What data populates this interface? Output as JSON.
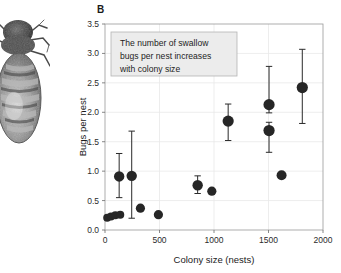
{
  "figure": {
    "panel_label": "B",
    "photo_alt": "swallow-bug-photograph"
  },
  "annotation": {
    "lines": [
      "The number of swallow",
      "bugs per nest increases",
      "with colony size"
    ],
    "fill_color": "#ececec",
    "border_color": "#b4b4b4"
  },
  "chart_data": {
    "type": "scatter",
    "title": "",
    "xlabel": "Colony size (nests)",
    "ylabel": "Bugs per nest",
    "xlim": [
      0,
      2000
    ],
    "ylim": [
      0.0,
      3.5
    ],
    "xticks": [
      0,
      500,
      1000,
      1500,
      2000
    ],
    "xticklabels": [
      "0",
      "500",
      "1000",
      "1500",
      "2000"
    ],
    "yticks": [
      0.0,
      0.5,
      1.0,
      1.5,
      2.0,
      2.5,
      3.0,
      3.5
    ],
    "yticklabels": [
      "0.0",
      "0.5",
      "1.0",
      "1.5",
      "2.0",
      "2.5",
      "3.0",
      "3.5"
    ],
    "grid": true,
    "legend": "none",
    "marker_color": "#262626",
    "points": [
      {
        "x": 20,
        "y": 0.21,
        "yerr_low": null,
        "yerr_high": null,
        "size": 4.0
      },
      {
        "x": 55,
        "y": 0.23,
        "yerr_low": null,
        "yerr_high": null,
        "size": 4.0
      },
      {
        "x": 95,
        "y": 0.25,
        "yerr_low": null,
        "yerr_high": null,
        "size": 4.0
      },
      {
        "x": 140,
        "y": 0.26,
        "yerr_low": null,
        "yerr_high": null,
        "size": 4.0
      },
      {
        "x": 130,
        "y": 0.91,
        "yerr_low": 0.55,
        "yerr_high": 1.3,
        "size": 5.2
      },
      {
        "x": 245,
        "y": 0.92,
        "yerr_low": 0.2,
        "yerr_high": 1.68,
        "size": 5.2
      },
      {
        "x": 325,
        "y": 0.37,
        "yerr_low": null,
        "yerr_high": null,
        "size": 4.6
      },
      {
        "x": 490,
        "y": 0.26,
        "yerr_low": null,
        "yerr_high": null,
        "size": 4.6
      },
      {
        "x": 850,
        "y": 0.76,
        "yerr_low": 0.62,
        "yerr_high": 0.92,
        "size": 5.2
      },
      {
        "x": 980,
        "y": 0.66,
        "yerr_low": null,
        "yerr_high": null,
        "size": 4.6
      },
      {
        "x": 1130,
        "y": 1.85,
        "yerr_low": 1.52,
        "yerr_high": 2.14,
        "size": 5.6
      },
      {
        "x": 1505,
        "y": 2.13,
        "yerr_low": 1.99,
        "yerr_high": 2.78,
        "size": 5.6
      },
      {
        "x": 1505,
        "y": 1.69,
        "yerr_low": 1.32,
        "yerr_high": 1.83,
        "size": 5.6
      },
      {
        "x": 1620,
        "y": 0.93,
        "yerr_low": null,
        "yerr_high": null,
        "size": 5.0
      },
      {
        "x": 1810,
        "y": 2.42,
        "yerr_low": 1.81,
        "yerr_high": 3.07,
        "size": 5.6
      }
    ]
  }
}
